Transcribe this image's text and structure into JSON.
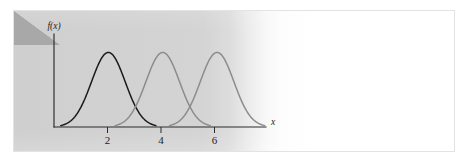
{
  "figure": {
    "background_color": "#ffffff",
    "panel_border_color": "#e3e3e3",
    "paper_wash_color": "#d2d2d2",
    "corner_fold_color": "#a8a8a8",
    "axis_color": "#2b2b2b"
  },
  "axes": {
    "ylabel": "f(x)",
    "xlabel": "x",
    "xticks": [
      {
        "value": 2,
        "label": "2"
      },
      {
        "value": 4,
        "label": "4"
      },
      {
        "value": 6,
        "label": "6"
      }
    ]
  },
  "chart_data": {
    "type": "line",
    "title": "",
    "xlabel": "x",
    "ylabel": "f(x)",
    "xlim": [
      0,
      7.8
    ],
    "ylim": [
      0,
      1.18
    ],
    "grid": false,
    "legend": null,
    "series": [
      {
        "name": "curve-1",
        "color": "#1a1a1a",
        "shape": "gaussian",
        "mean": 2,
        "sigma": 0.62,
        "peak": 1.0,
        "x_start": 0.25,
        "x_end": 3.75,
        "x": [
          0.25,
          0.5,
          0.75,
          1.0,
          1.25,
          1.5,
          1.75,
          2.0,
          2.25,
          2.5,
          2.75,
          3.0,
          3.25,
          3.5,
          3.75
        ],
        "y": [
          0.013,
          0.027,
          0.055,
          0.103,
          0.181,
          0.296,
          0.449,
          0.629,
          0.817,
          0.978,
          1.0,
          0.978,
          0.817,
          0.629,
          0.449
        ]
      },
      {
        "name": "curve-2",
        "color": "#8c8c8c",
        "shape": "gaussian",
        "mean": 4,
        "sigma": 0.62,
        "peak": 1.0,
        "x_start": 2.25,
        "x_end": 5.75,
        "x": [
          2.25,
          2.5,
          2.75,
          3.0,
          3.25,
          3.5,
          3.75,
          4.0,
          4.25,
          4.5,
          4.75,
          5.0,
          5.25,
          5.5,
          5.75
        ],
        "y": [
          0.013,
          0.027,
          0.055,
          0.103,
          0.181,
          0.296,
          0.449,
          0.629,
          0.817,
          0.978,
          1.0,
          0.978,
          0.817,
          0.629,
          0.449
        ]
      },
      {
        "name": "curve-3",
        "color": "#8c8c8c",
        "shape": "gaussian",
        "mean": 6,
        "sigma": 0.62,
        "peak": 1.0,
        "x_start": 4.25,
        "x_end": 7.75,
        "x": [
          4.25,
          4.5,
          4.75,
          5.0,
          5.25,
          5.5,
          5.75,
          6.0,
          6.25,
          6.5,
          6.75,
          7.0,
          7.25,
          7.5,
          7.75
        ],
        "y": [
          0.013,
          0.027,
          0.055,
          0.103,
          0.181,
          0.296,
          0.449,
          0.629,
          0.817,
          0.978,
          1.0,
          0.978,
          0.817,
          0.629,
          0.449
        ]
      }
    ]
  }
}
